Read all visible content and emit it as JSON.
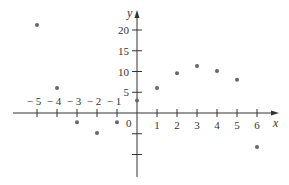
{
  "chart_data": {
    "type": "scatter",
    "title": "",
    "xlabel": "x",
    "ylabel": "y",
    "x": [
      -5,
      -4,
      -3,
      -2,
      -1,
      0,
      1,
      2,
      3,
      4,
      5,
      6
    ],
    "y": [
      21.2,
      6,
      -2.2,
      -4.8,
      -2.2,
      3,
      6,
      9.6,
      11.3,
      10.1,
      8,
      -8.2
    ],
    "series": [
      {
        "name": "data",
        "points": [
          {
            "x": -5,
            "y": 21.2
          },
          {
            "x": -4,
            "y": 6
          },
          {
            "x": -3,
            "y": -2.2
          },
          {
            "x": -2,
            "y": -4.8
          },
          {
            "x": -1,
            "y": -2.2
          },
          {
            "x": 0,
            "y": 3
          },
          {
            "x": 1,
            "y": 6
          },
          {
            "x": 2,
            "y": 9.6
          },
          {
            "x": 3,
            "y": 11.3
          },
          {
            "x": 4,
            "y": 10.1
          },
          {
            "x": 5,
            "y": 8
          },
          {
            "x": 6,
            "y": -8.2
          }
        ]
      }
    ],
    "x_ticks": [
      -5,
      -4,
      -3,
      -2,
      -1,
      1,
      2,
      3,
      4,
      5,
      6
    ],
    "x_tick_labels": [
      "− 5",
      "− 4",
      "− 3",
      "− 2",
      "− 1",
      "1",
      "2",
      "3",
      "4",
      "5",
      "6"
    ],
    "y_ticks": [
      20,
      15,
      10,
      5,
      -5,
      -10
    ],
    "y_tick_labels": [
      "20",
      "15",
      "10",
      "5",
      "",
      ""
    ],
    "origin_label": "0",
    "xlim": [
      -6.2,
      6.9
    ],
    "ylim": [
      -15.5,
      24
    ],
    "grid": false,
    "legend": "none",
    "colors": {
      "axis": "#333333",
      "point": "#666666",
      "text": "#333333"
    }
  }
}
